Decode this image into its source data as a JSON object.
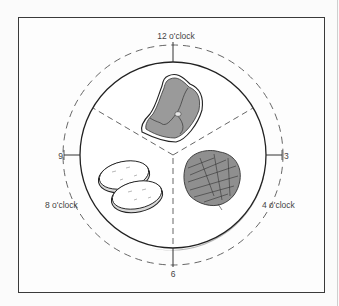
{
  "diagram": {
    "labels": {
      "twelve": "12 o'clock",
      "three": "3",
      "six": "6",
      "nine": "9",
      "eight": "8 o'clock",
      "four": "4 o'clock"
    },
    "foods": [
      {
        "name": "meat",
        "position": "12 o'clock"
      },
      {
        "name": "green beans",
        "position": "4 o'clock"
      },
      {
        "name": "potatoes",
        "position": "8 o'clock"
      }
    ],
    "colors": {
      "line": "#2a2a2a",
      "food_fill": "#9a9a9a",
      "shadow": "#b5b5b5",
      "text": "#444444"
    }
  }
}
